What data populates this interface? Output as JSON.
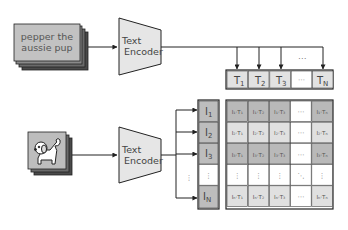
{
  "text_input": {
    "line1": "pepper the",
    "line2": "aussie pup"
  },
  "text_encoder": {
    "line1": "Text",
    "line2": "Encoder"
  },
  "image_encoder": {
    "line1": "Text",
    "line2": "Encoder"
  },
  "text_embeddings": {
    "labels": [
      "T",
      "T",
      "T",
      "⋯",
      "T"
    ],
    "subs": [
      "1",
      "2",
      "3",
      "",
      "N"
    ],
    "ellipsis_above": "⋯"
  },
  "image_embeddings": {
    "labels": [
      "I",
      "I",
      "I",
      "⋮",
      "I"
    ],
    "subs": [
      "1",
      "2",
      "3",
      "",
      "N"
    ]
  },
  "matrix": {
    "rows": [
      [
        "I₁·T₁",
        "I₁·T₂",
        "I₁·T₃",
        "⋯",
        "I₁·Tₙ"
      ],
      [
        "I₂·T₁",
        "I₂·T₂",
        "I₂·T₃",
        "⋯",
        "I₂·Tₙ"
      ],
      [
        "I₃·T₁",
        "I₃·T₂",
        "I₃·T₃",
        "⋯",
        "I₃·Tₙ"
      ],
      [
        "⋮",
        "⋮",
        "⋮",
        "⋱",
        "⋮"
      ],
      [
        "Iₙ·T₁",
        "Iₙ·T₂",
        "Iₙ·T₃",
        "⋯",
        "Iₙ·Tₙ"
      ]
    ],
    "row_fills": [
      "#b9b9b9",
      "#e0e0e0",
      "#b9b9b9",
      "#ffffff",
      "#e0e0e0"
    ]
  },
  "colors": {
    "stroke": "#333333",
    "encoder_fill": "#e6e6e6",
    "card_front": "#bdbdbd",
    "card_back": "#555555",
    "t_cell": "#e2e2e2",
    "i_cell": "#bdbdbd",
    "text": "#444444"
  }
}
